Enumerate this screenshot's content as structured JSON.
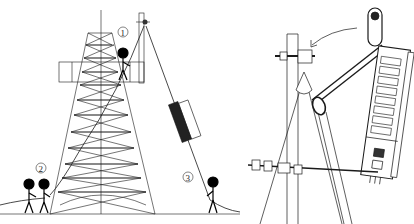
{
  "figure": {
    "panels": [
      {
        "id": "left",
        "description": "Lattice tower hoisting scene",
        "labels": [
          {
            "text": "1",
            "x": 123,
            "y": 32
          },
          {
            "text": "2",
            "x": 41,
            "y": 168
          },
          {
            "text": "3",
            "x": 188,
            "y": 177
          }
        ],
        "workers": [
          {
            "role": "climber-on-tower",
            "label": "1"
          },
          {
            "role": "ground-hauler-a",
            "label": "2"
          },
          {
            "role": "ground-hauler-b",
            "label": "2"
          },
          {
            "role": "guide-rope-handler",
            "label": "3"
          }
        ]
      },
      {
        "id": "right",
        "description": "Close-up of pulley clamp on pole with equipment hoisted by slings"
      }
    ],
    "colors": {
      "line": "#1a1a1a",
      "fill": "#000000",
      "background": "#ffffff"
    }
  }
}
